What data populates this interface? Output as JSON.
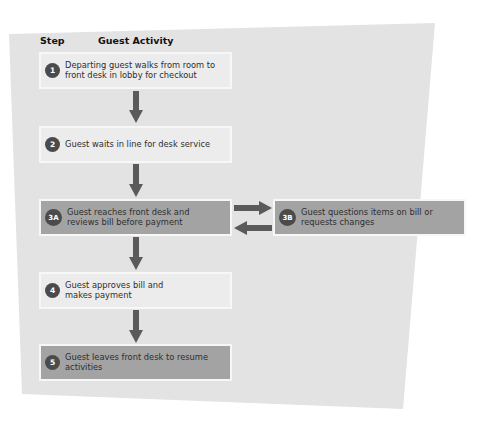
{
  "diagram": {
    "headers": {
      "step": "Step",
      "activity": "Guest Activity"
    },
    "steps": [
      {
        "id": "1",
        "text_line1": "Departing guest walks from room to",
        "text_line2": "front desk in lobby for checkout",
        "shade": "light"
      },
      {
        "id": "2",
        "text_line1": "Guest waits in line for desk service",
        "text_line2": "",
        "shade": "light"
      },
      {
        "id": "3A",
        "text_line1": "Guest reaches front desk and",
        "text_line2": "reviews bill before payment",
        "shade": "dark"
      },
      {
        "id": "3B",
        "text_line1": "Guest questions items on bill or",
        "text_line2": "requests changes",
        "shade": "dark"
      },
      {
        "id": "4",
        "text_line1": "Guest approves bill and",
        "text_line2": "makes payment",
        "shade": "light"
      },
      {
        "id": "5",
        "text_line1": "Guest leaves front desk to resume",
        "text_line2": "activities",
        "shade": "dark"
      }
    ],
    "flow": [
      "1→2",
      "2→3A",
      "3A⇄3B",
      "3A→4",
      "4→5"
    ],
    "colors": {
      "panel": "#e3e3e3",
      "light_box": "#ececec",
      "dark_box": "#a3a3a3",
      "arrow": "#5a5a5a",
      "badge": "#4b4b4b"
    }
  }
}
